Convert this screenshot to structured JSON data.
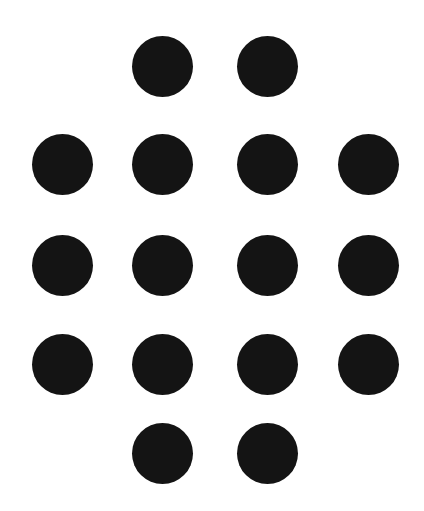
{
  "figure": {
    "width": 424,
    "height": 511,
    "background": "#ffffff",
    "dot_color": "#141414",
    "dot_diameter": 61,
    "dot_count": 16,
    "columns_x": [
      62,
      162.5,
      267.5,
      368.5
    ],
    "rows_y": [
      66,
      164,
      265.5,
      364,
      453.5
    ],
    "dots": [
      {
        "row": 1,
        "col": 2,
        "cx": 162.5,
        "cy": 66
      },
      {
        "row": 1,
        "col": 3,
        "cx": 267.5,
        "cy": 66
      },
      {
        "row": 2,
        "col": 1,
        "cx": 62,
        "cy": 164
      },
      {
        "row": 2,
        "col": 2,
        "cx": 162.5,
        "cy": 164
      },
      {
        "row": 2,
        "col": 3,
        "cx": 267.5,
        "cy": 164
      },
      {
        "row": 2,
        "col": 4,
        "cx": 368.5,
        "cy": 164
      },
      {
        "row": 3,
        "col": 1,
        "cx": 62,
        "cy": 265.5
      },
      {
        "row": 3,
        "col": 2,
        "cx": 162.5,
        "cy": 265.5
      },
      {
        "row": 3,
        "col": 3,
        "cx": 267.5,
        "cy": 265.5
      },
      {
        "row": 3,
        "col": 4,
        "cx": 368.5,
        "cy": 265.5
      },
      {
        "row": 4,
        "col": 1,
        "cx": 62,
        "cy": 364
      },
      {
        "row": 4,
        "col": 2,
        "cx": 162.5,
        "cy": 364
      },
      {
        "row": 4,
        "col": 3,
        "cx": 267.5,
        "cy": 364
      },
      {
        "row": 4,
        "col": 4,
        "cx": 368.5,
        "cy": 364
      },
      {
        "row": 5,
        "col": 2,
        "cx": 162.5,
        "cy": 453.5
      },
      {
        "row": 5,
        "col": 3,
        "cx": 267.5,
        "cy": 453.5
      }
    ]
  }
}
